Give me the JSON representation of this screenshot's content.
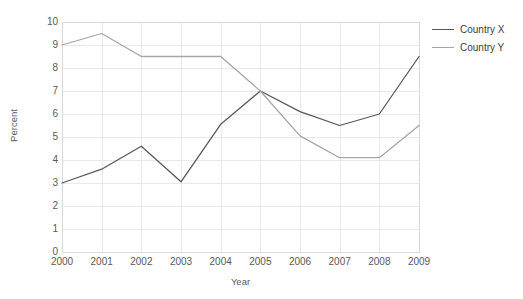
{
  "chart_data": {
    "type": "line",
    "title": "",
    "xlabel": "Year",
    "ylabel": "Percent",
    "categories": [
      "2000",
      "2001",
      "2002",
      "2003",
      "2004",
      "2005",
      "2006",
      "2007",
      "2008",
      "2009"
    ],
    "x": [
      2000,
      2001,
      2002,
      2003,
      2004,
      2005,
      2006,
      2007,
      2008,
      2009
    ],
    "xlim": [
      2000,
      2009
    ],
    "ylim": [
      0,
      10
    ],
    "yticks": [
      0,
      1,
      2,
      3,
      4,
      5,
      6,
      7,
      8,
      9,
      10
    ],
    "ytick_labels": [
      "0",
      "1",
      "2",
      "3",
      "4",
      "5",
      "6",
      "7",
      "8",
      "9",
      "10"
    ],
    "grid": true,
    "grid_axis": "both",
    "legend_position": "right",
    "series": [
      {
        "name": "Country X",
        "color": "#595959",
        "values": [
          3.0,
          3.6,
          4.6,
          3.05,
          5.55,
          7.0,
          6.1,
          5.5,
          6.0,
          8.5
        ]
      },
      {
        "name": "Country Y",
        "color": "#a6a6a6",
        "values": [
          9.0,
          9.5,
          8.5,
          8.5,
          8.5,
          7.0,
          5.05,
          4.1,
          4.1,
          5.5
        ]
      }
    ]
  },
  "axes": {
    "y_title": "Percent",
    "x_title": "Year"
  },
  "legend": {
    "items": [
      {
        "label": "Country X",
        "color": "#595959"
      },
      {
        "label": "Country Y",
        "color": "#a6a6a6"
      }
    ]
  },
  "colors": {
    "series_x": "#595959",
    "series_y": "#a6a6a6",
    "grid": "#e9e9e9",
    "plot_border": "#d9d9d9",
    "text": "#595959",
    "background": "#ffffff"
  },
  "layout": {
    "plot_left": 62,
    "plot_right": 419,
    "plot_top": 22,
    "plot_bottom": 252
  }
}
